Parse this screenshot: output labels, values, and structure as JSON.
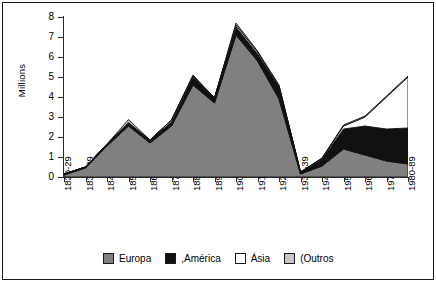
{
  "chart_data": {
    "type": "area",
    "title": "",
    "subtitle": "",
    "xlabel": "",
    "ylabel": "Millions",
    "ylim": [
      0,
      8
    ],
    "xlim_categories_count": 17,
    "grid": false,
    "stacked": true,
    "legend_position": "bottom",
    "yticks": [
      0,
      1,
      2,
      3,
      4,
      5,
      6,
      7,
      8
    ],
    "ytick_labels": [
      "0",
      "1",
      "2",
      "3",
      "4",
      "5",
      "6",
      "7",
      "8"
    ],
    "categories": [
      "1820-29",
      "1830-39",
      "1840-49",
      "1850-59",
      "1860-69",
      "1870-79",
      "1880-89",
      "1890-99",
      "1900-09",
      "1910-19",
      "1920-29",
      "1930-39",
      "1940-49",
      "1950-59",
      "1960-69",
      "1970-79",
      "1980-89"
    ],
    "series": [
      {
        "name": "Europa",
        "color": "#808080",
        "values": [
          0.1,
          0.45,
          1.55,
          2.55,
          1.7,
          2.55,
          4.6,
          3.7,
          7.1,
          5.8,
          3.9,
          0.15,
          0.55,
          1.4,
          1.1,
          0.8,
          0.65
        ]
      },
      {
        "name": ",América",
        "color": "#111111",
        "values": [
          0.05,
          0.05,
          0.1,
          0.15,
          0.15,
          0.2,
          0.4,
          0.25,
          0.4,
          0.35,
          0.6,
          0.1,
          0.35,
          1.0,
          1.45,
          1.6,
          1.8
        ]
      },
      {
        "name": "Ásia",
        "color": "#ffffff",
        "values": [
          0.0,
          0.0,
          0.0,
          0.02,
          0.0,
          0.1,
          0.05,
          0.0,
          0.1,
          0.1,
          0.05,
          0.0,
          0.03,
          0.15,
          0.45,
          1.6,
          2.55
        ]
      },
      {
        "name": "(Outros",
        "color": "#c6c6c6",
        "values": [
          0.0,
          0.0,
          0.0,
          0.15,
          0.0,
          0.0,
          0.05,
          0.0,
          0.1,
          0.05,
          0.05,
          0.0,
          0.02,
          0.05,
          0.05,
          0.05,
          0.05
        ]
      }
    ],
    "totals": [
      0.15,
      0.5,
      1.65,
      2.87,
      1.85,
      2.85,
      5.1,
      3.95,
      7.7,
      6.3,
      4.6,
      0.25,
      0.95,
      2.6,
      3.05,
      4.05,
      5.05
    ]
  },
  "legend": {
    "items": [
      {
        "label": "Europa",
        "color": "#808080"
      },
      {
        "label": ",América",
        "color": "#111111"
      },
      {
        "label": "Ásia",
        "color": "#ffffff"
      },
      {
        "label": "(Outros",
        "color": "#c6c6c6"
      }
    ]
  },
  "axes": {
    "y_title": "Millions"
  }
}
